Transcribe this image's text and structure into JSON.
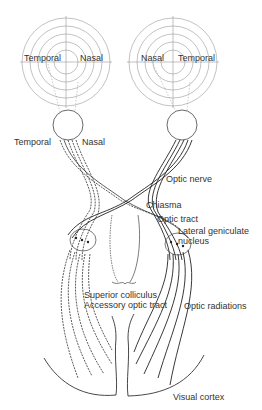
{
  "diagram": {
    "visual_fields": {
      "left": {
        "temporal_label": "Temporal",
        "nasal_label": "Nasal"
      },
      "right": {
        "nasal_label": "Nasal",
        "temporal_label": "Temporal"
      }
    },
    "eye_labels": {
      "temporal": "Temporal",
      "nasal": "Nasal"
    },
    "structures": {
      "optic_nerve": "Optic nerve",
      "chiasma": "Chiasma",
      "optic_tract": "Optic tract",
      "lgn_line1": "Lateral geniculate",
      "lgn_line2": "nucleus",
      "superior_colliculus": "Superior colliculus",
      "accessory_optic_tract": "Accessory optic tract",
      "optic_radiations": "Optic radiations",
      "visual_cortex": "Visual cortex"
    },
    "colors": {
      "line": "#333333",
      "field_line": "#888888",
      "text": "#333333"
    }
  }
}
